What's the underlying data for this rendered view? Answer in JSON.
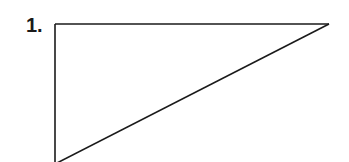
{
  "figure": {
    "label": "1.",
    "shape": "right-triangle",
    "vertices": {
      "top_left": [
        55,
        24
      ],
      "top_right": [
        329,
        24
      ],
      "bottom_left": [
        55,
        162
      ]
    },
    "stroke_color": "#1a1a1a"
  }
}
